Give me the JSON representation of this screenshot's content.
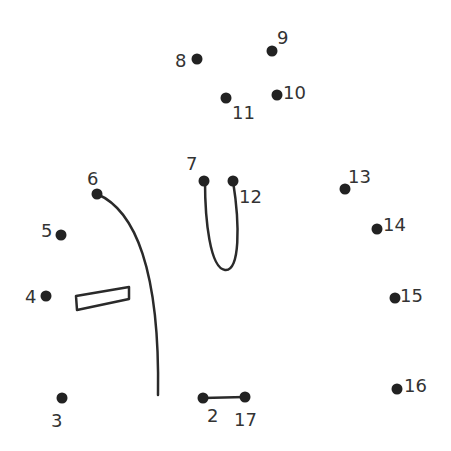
{
  "colors": {
    "ink": "#222222",
    "label": "#333333",
    "background": "#ffffff"
  },
  "dots": [
    {
      "n": "2",
      "x": 203,
      "y": 398,
      "lx": 207,
      "ly": 422
    },
    {
      "n": "3",
      "x": 62,
      "y": 398,
      "lx": 51,
      "ly": 427
    },
    {
      "n": "4",
      "x": 46,
      "y": 296,
      "lx": 25,
      "ly": 303
    },
    {
      "n": "5",
      "x": 61,
      "y": 235,
      "lx": 41,
      "ly": 237
    },
    {
      "n": "6",
      "x": 97,
      "y": 194,
      "lx": 87,
      "ly": 185
    },
    {
      "n": "7",
      "x": 204,
      "y": 181,
      "lx": 186,
      "ly": 170
    },
    {
      "n": "8",
      "x": 197,
      "y": 59,
      "lx": 175,
      "ly": 67
    },
    {
      "n": "9",
      "x": 272,
      "y": 51,
      "lx": 277,
      "ly": 44
    },
    {
      "n": "10",
      "x": 277,
      "y": 95,
      "lx": 283,
      "ly": 99
    },
    {
      "n": "11",
      "x": 226,
      "y": 98,
      "lx": 232,
      "ly": 119
    },
    {
      "n": "12",
      "x": 233,
      "y": 181,
      "lx": 239,
      "ly": 203
    },
    {
      "n": "13",
      "x": 345,
      "y": 189,
      "lx": 348,
      "ly": 183
    },
    {
      "n": "14",
      "x": 377,
      "y": 229,
      "lx": 383,
      "ly": 231
    },
    {
      "n": "15",
      "x": 395,
      "y": 298,
      "lx": 400,
      "ly": 302
    },
    {
      "n": "16",
      "x": 397,
      "y": 389,
      "lx": 404,
      "ly": 392
    },
    {
      "n": "17",
      "x": 245,
      "y": 397,
      "lx": 234,
      "ly": 426
    }
  ],
  "strokes": [
    {
      "name": "curve-6-down",
      "d": "M97,194 C135,210 160,270 158,395"
    },
    {
      "name": "loop-7-12",
      "d": "M205,181 C205,220 210,268 225,270 C240,272 240,225 233,181"
    },
    {
      "name": "segment-2-17",
      "d": "M203,398 L245,397"
    },
    {
      "name": "rect-shape",
      "d": "M76,296 L129,287 L129,299 L77,310 Z"
    }
  ]
}
